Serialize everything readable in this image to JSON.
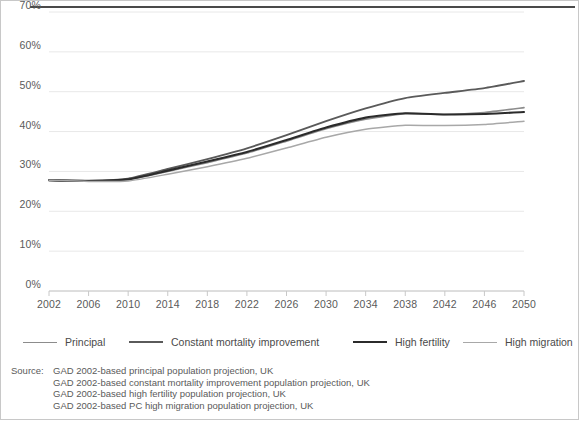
{
  "chart_data": {
    "type": "line",
    "title": "",
    "subtitle": "",
    "xlabel": "",
    "ylabel": "",
    "grid": true,
    "legend_position": "bottom",
    "xlim": [
      2002,
      2050
    ],
    "ylim": [
      0,
      70
    ],
    "x": [
      2002,
      2006,
      2010,
      2014,
      2018,
      2022,
      2026,
      2030,
      2034,
      2038,
      2042,
      2046,
      2050
    ],
    "categories": [
      "2002",
      "2006",
      "2010",
      "2014",
      "2018",
      "2022",
      "2026",
      "2030",
      "2034",
      "2038",
      "2042",
      "2046",
      "2050"
    ],
    "ytick_labels": [
      "0%",
      "10%",
      "20%",
      "30%",
      "40%",
      "50%",
      "60%",
      "70%"
    ],
    "ytick_values": [
      0,
      10,
      20,
      30,
      40,
      50,
      60,
      70
    ],
    "series": [
      {
        "name": "Principal",
        "color": "#8c8c8c",
        "width": 1.6,
        "values": [
          27.8,
          27.6,
          27.9,
          30.0,
          32.2,
          34.6,
          37.6,
          40.7,
          43.1,
          44.5,
          44.3,
          44.8,
          46.0
        ]
      },
      {
        "name": "Constant mortality improvement",
        "color": "#5a5a5a",
        "width": 1.9,
        "values": [
          27.8,
          27.7,
          28.2,
          30.6,
          33.1,
          35.8,
          39.1,
          42.6,
          45.8,
          48.4,
          49.7,
          50.9,
          52.7
        ]
      },
      {
        "name": "High fertility",
        "color": "#2b2b2b",
        "width": 2.1,
        "values": [
          27.8,
          27.6,
          28.0,
          30.2,
          32.5,
          34.9,
          37.9,
          41.0,
          43.5,
          44.6,
          44.3,
          44.4,
          44.9
        ]
      },
      {
        "name": "High migration",
        "color": "#a8a8a8",
        "width": 1.5,
        "values": [
          27.8,
          27.5,
          27.6,
          29.3,
          31.2,
          33.3,
          35.9,
          38.6,
          40.6,
          41.6,
          41.5,
          41.8,
          42.6
        ]
      }
    ]
  },
  "legend": {
    "items": [
      {
        "label": "Principal",
        "color": "#8c8c8c",
        "width": 1.6,
        "left": 0
      },
      {
        "label": "Constant mortality improvement",
        "color": "#5a5a5a",
        "width": 2.0,
        "left": 106
      },
      {
        "label": "High fertility",
        "color": "#2b2b2b",
        "width": 2.4,
        "left": 330
      },
      {
        "label": "High migration",
        "color": "#a8a8a8",
        "width": 1.5,
        "left": 440
      }
    ]
  },
  "source": {
    "label": "Source:",
    "lines": [
      "GAD 2002-based principal population projection, UK",
      "GAD 2002-based constant mortality improvement population projection, UK",
      "GAD 2002-based high fertility population projection, UK",
      "GAD 2002-based PC high migration population projection, UK"
    ]
  },
  "colors": {
    "axis": "#c8c8c8",
    "grid": "#e8e8e8",
    "text": "#5a5a5a",
    "rule": "#4a4a4a",
    "border": "#c8c8c8"
  }
}
